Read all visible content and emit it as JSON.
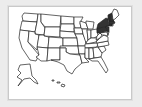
{
  "map": {
    "title": "United States map",
    "default_fill": "#ffffff",
    "highlight_fill": "#333333",
    "border_color": "#222222",
    "background": "#ececec",
    "highlighted_states": [
      "NY",
      "PA",
      "NJ",
      "VT",
      "NH",
      "MA",
      "CT"
    ],
    "states": [
      {
        "id": "WA"
      },
      {
        "id": "OR"
      },
      {
        "id": "CA"
      },
      {
        "id": "ID"
      },
      {
        "id": "NV"
      },
      {
        "id": "MT"
      },
      {
        "id": "WY"
      },
      {
        "id": "UT"
      },
      {
        "id": "AZ"
      },
      {
        "id": "CO"
      },
      {
        "id": "NM"
      },
      {
        "id": "ND"
      },
      {
        "id": "SD"
      },
      {
        "id": "NE"
      },
      {
        "id": "KS"
      },
      {
        "id": "OK"
      },
      {
        "id": "TX"
      },
      {
        "id": "MN"
      },
      {
        "id": "IA"
      },
      {
        "id": "MO"
      },
      {
        "id": "AR"
      },
      {
        "id": "LA"
      },
      {
        "id": "WI"
      },
      {
        "id": "IL"
      },
      {
        "id": "MI"
      },
      {
        "id": "IN"
      },
      {
        "id": "OH"
      },
      {
        "id": "KY"
      },
      {
        "id": "TN"
      },
      {
        "id": "MS"
      },
      {
        "id": "AL"
      },
      {
        "id": "GA"
      },
      {
        "id": "FL"
      },
      {
        "id": "SC"
      },
      {
        "id": "NC"
      },
      {
        "id": "VA"
      },
      {
        "id": "WV"
      },
      {
        "id": "MD"
      },
      {
        "id": "DE"
      },
      {
        "id": "PA"
      },
      {
        "id": "NJ"
      },
      {
        "id": "NY"
      },
      {
        "id": "CT"
      },
      {
        "id": "RI"
      },
      {
        "id": "MA"
      },
      {
        "id": "VT"
      },
      {
        "id": "NH"
      },
      {
        "id": "ME"
      },
      {
        "id": "AK"
      },
      {
        "id": "HI"
      }
    ]
  }
}
